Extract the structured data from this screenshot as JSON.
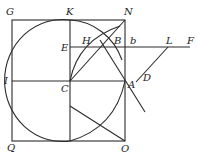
{
  "diagram": {
    "type": "geometric-construction",
    "labels": {
      "G": "G",
      "K": "K",
      "N": "N",
      "E": "E",
      "H": "H",
      "B": "B",
      "b": "b",
      "L": "L",
      "F": "F",
      "I": "I",
      "C": "C",
      "A": "A",
      "D": "D",
      "Q": "Q",
      "O": "O"
    },
    "points": {
      "G": [
        12,
        20
      ],
      "K": [
        70,
        20
      ],
      "N": [
        125,
        20
      ],
      "E": [
        70,
        47
      ],
      "H": [
        86,
        47
      ],
      "B": [
        110,
        47
      ],
      "b": [
        125,
        47
      ],
      "L": [
        168,
        47
      ],
      "F": [
        190,
        47
      ],
      "I": [
        12,
        81
      ],
      "C": [
        70,
        81
      ],
      "A": [
        125,
        81
      ],
      "D": [
        142,
        105
      ],
      "Q": [
        12,
        141
      ],
      "O": [
        125,
        141
      ]
    },
    "colors": {
      "stroke": "#2a2a2a",
      "text": "#222222",
      "background": "#ffffff"
    }
  }
}
